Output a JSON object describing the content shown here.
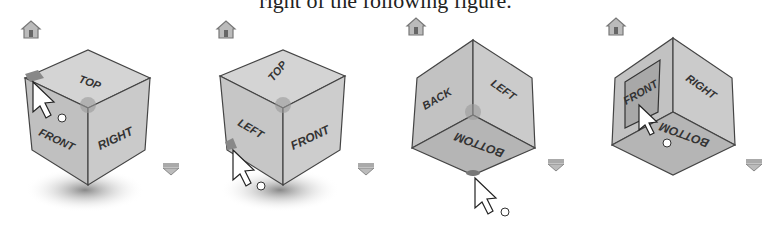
{
  "caption": "right of the following figure.",
  "viewcubes": [
    {
      "id": "cube-1",
      "faces": {
        "top": "TOP",
        "left": "FRONT",
        "right": "RIGHT"
      },
      "hover": "corner-top-left",
      "cursor": "orbit"
    },
    {
      "id": "cube-2",
      "faces": {
        "top": "TOP",
        "left": "LEFT",
        "right": "FRONT"
      },
      "hover": "corner-bottom-left",
      "cursor": "orbit"
    },
    {
      "id": "cube-3",
      "faces": {
        "left": "BACK",
        "right": "LEFT",
        "bottom": "BOTTOM"
      },
      "hover": "corner-bottom",
      "cursor": "orbit"
    },
    {
      "id": "cube-4",
      "faces": {
        "left": "FRONT",
        "right": "RIGHT",
        "bottom": "BOTTOM"
      },
      "hover": "face-front",
      "cursor": "orbit"
    }
  ],
  "icons": {
    "home": "home-icon",
    "menu": "viewcube-menu-icon"
  },
  "colors": {
    "face": "#c8c8c8",
    "edge": "#444444",
    "highlight": "#8a8a8a",
    "shadow": "#999999"
  }
}
